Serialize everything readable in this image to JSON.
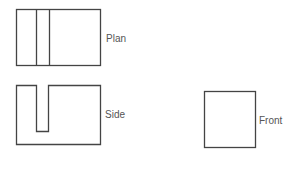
{
  "views": {
    "plan": {
      "label": "Plan"
    },
    "side": {
      "label": "Side"
    },
    "front": {
      "label": "Front"
    }
  },
  "colors": {
    "stroke": "#444444",
    "label": "#555555",
    "background": "#ffffff"
  }
}
